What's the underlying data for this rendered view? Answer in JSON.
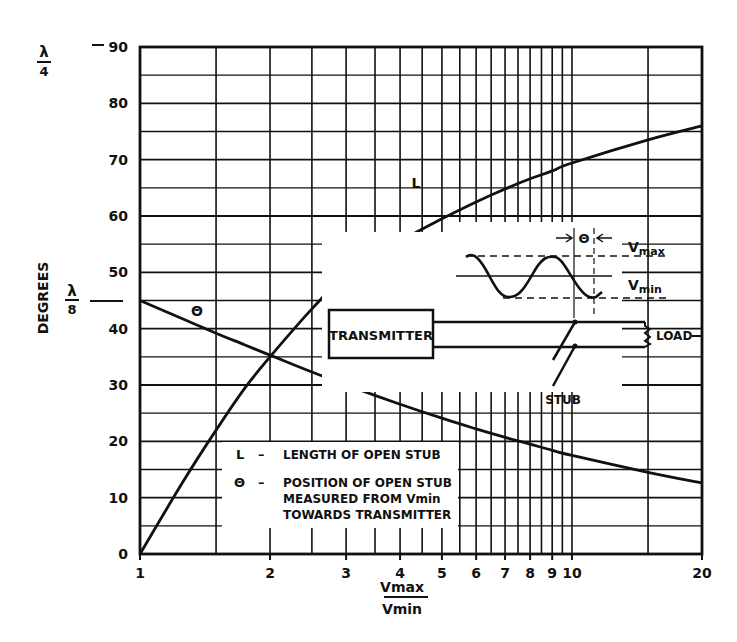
{
  "chart_data": {
    "type": "line",
    "title": "",
    "xlabel_num": "Vmax",
    "xlabel_den": "Vmin",
    "ylabel": "DEGREES",
    "x_scale": "log",
    "xlim": [
      1,
      20
    ],
    "ylim": [
      0,
      90
    ],
    "grid": true,
    "x_ticks": [
      1,
      2,
      3,
      4,
      5,
      6,
      7,
      8,
      9,
      10,
      20
    ],
    "x_tick_labels": [
      "1",
      "2",
      "3",
      "4",
      "5",
      "6",
      "7",
      "8",
      "9",
      "10",
      "20"
    ],
    "y_ticks": [
      0,
      10,
      20,
      30,
      40,
      50,
      60,
      70,
      80,
      90
    ],
    "y_tick_labels": [
      "0",
      "10",
      "20",
      "30",
      "40",
      "50",
      "60",
      "70",
      "80",
      "90"
    ],
    "y_special_marks": [
      {
        "value": 90,
        "label_num": "λ",
        "label_den": "4"
      },
      {
        "value": 45,
        "label_num": "λ",
        "label_den": "8"
      }
    ],
    "series": [
      {
        "name": "L",
        "description": "LENGTH OF OPEN STUB",
        "x": [
          1,
          1.25,
          1.5,
          1.75,
          2,
          2.5,
          3,
          4,
          5,
          6,
          7,
          8,
          9,
          10,
          15,
          20
        ],
        "y": [
          0,
          12.5,
          22,
          29.5,
          35,
          43.5,
          49.5,
          55.5,
          59.5,
          62.5,
          64.8,
          66.6,
          68,
          69.4,
          73.5,
          76
        ]
      },
      {
        "name": "Θ",
        "description": "POSITION OF OPEN STUB MEASURED FROM Vmin TOWARDS TRANSMITTER",
        "x": [
          1,
          1.25,
          1.5,
          1.75,
          2,
          2.5,
          3,
          4,
          5,
          6,
          7,
          8,
          9,
          10,
          15,
          20
        ],
        "y": [
          45,
          41.8,
          39.2,
          37.1,
          35.3,
          32.3,
          30,
          26.6,
          24.1,
          22.2,
          20.7,
          19.5,
          18.4,
          17.5,
          14.5,
          12.6
        ]
      }
    ],
    "curve_labels": {
      "L": "L",
      "theta": "Θ"
    },
    "legend": [
      {
        "symbol": "L",
        "dash": "–",
        "text": [
          "LENGTH OF OPEN STUB"
        ]
      },
      {
        "symbol": "Θ",
        "dash": "–",
        "text": [
          "POSITION OF OPEN STUB",
          "MEASURED FROM Vmin",
          "TOWARDS TRANSMITTER"
        ]
      }
    ]
  },
  "diagram": {
    "transmitter_label": "TRANSMITTER",
    "load_label": "LOAD",
    "stub_label": "STUB",
    "vmax_label": "V",
    "vmax_sub": "max",
    "vmin_label": "V",
    "vmin_sub": "min",
    "theta_label": "Θ"
  }
}
